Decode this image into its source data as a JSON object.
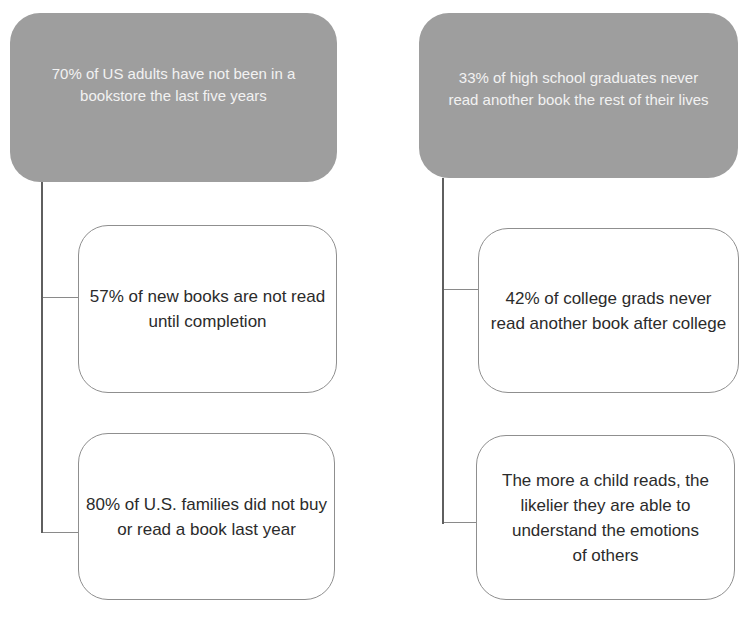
{
  "diagram_title": "Reading statistics mind map",
  "colors": {
    "root_fill": "#9e9e9e",
    "root_text": "#f2f2f2",
    "child_border": "#8f8f8f",
    "child_text": "#2b2b2b",
    "connector": "#5f5f5f",
    "background": "#ffffff"
  },
  "nodes": {
    "left_root": {
      "text": "70% of US adults have not been in a bookstore the last five years",
      "lines": [
        "70% of US adults have not been in a",
        "bookstore the last five years"
      ]
    },
    "left_child1": {
      "text": "57% of new books are not read until completion",
      "lines": [
        "57% of new books are not read",
        "until completion"
      ]
    },
    "left_child2": {
      "text": "80% of U.S. families did not buy or read a book last year",
      "lines": [
        "80% of U.S. families did not buy",
        "or read a book last year"
      ]
    },
    "right_root": {
      "text": "33% of high school graduates never read another book the rest of their lives",
      "lines": [
        "33% of high school graduates never",
        "read another book the rest of their lives"
      ]
    },
    "right_child1": {
      "text": "42% of college grads never read another book after college",
      "lines": [
        "42% of college grads never",
        "read another book after college"
      ]
    },
    "right_child2": {
      "text": "The more a child reads, the likelier they are able to understand the emotions of others",
      "lines": [
        "The more a child reads, the",
        "likelier they are able to",
        "understand the emotions",
        "of others"
      ]
    }
  }
}
